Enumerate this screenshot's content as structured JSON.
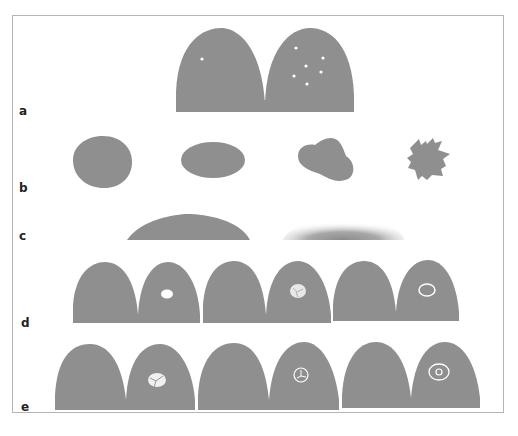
{
  "figure": {
    "panel_labels": [
      "a",
      "b",
      "c",
      "d",
      "e"
    ],
    "fill_color": "#8f8f8f",
    "background": "#ffffff",
    "border_color": "#b5b5b5",
    "rows": {
      "a": {
        "description": "Two adjacent dome shapes; left dome with one white dot, right dome with seven scattered white dots"
      },
      "b": {
        "description": "Four solid shapes: round, oval, lobulated, spiculated/irregular"
      },
      "c": {
        "description": "Flat dome with sharp edge vs. flat dome with blurred/gradient edge"
      },
      "d": {
        "description": "Three dome pairs; right domes contain a white oval, a white mottled oval, and a white ring"
      },
      "e": {
        "description": "Three dome pairs; right domes contain a white mottled blob, a ring with internal lines, and a target-like double ring"
      }
    }
  }
}
